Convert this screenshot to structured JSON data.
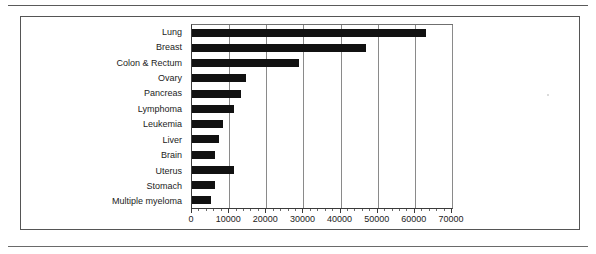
{
  "page": {
    "rule_top": "horizontal-rule",
    "rule_bottom": "horizontal-rule"
  },
  "chart_data": {
    "type": "bar",
    "orientation": "horizontal",
    "title": "",
    "subtitle": "",
    "xlabel": "",
    "ylabel": "",
    "xlim": [
      0,
      70000
    ],
    "ylim": null,
    "grid": true,
    "legend": false,
    "legend_position": "none",
    "bar_color": "#111111",
    "gridline_color": "#8a8a8a",
    "categories": [
      "Lung",
      "Breast",
      "Colon & Rectum",
      "Ovary",
      "Pancreas",
      "Lymphoma",
      "Leukemia",
      "Liver",
      "Brain",
      "Uterus",
      "Stomach",
      "Multiple myeloma"
    ],
    "values": [
      63000,
      46900,
      28700,
      14500,
      13300,
      11200,
      8400,
      7300,
      6100,
      11300,
      6200,
      5100
    ],
    "xticks": [
      0,
      10000,
      20000,
      30000,
      40000,
      50000,
      60000,
      70000
    ],
    "xticklabels": [
      "0",
      "10000",
      "20000",
      "30000",
      "40000",
      "50000",
      "60000",
      "70000"
    ],
    "minor_ticks_per_interval": 5
  }
}
